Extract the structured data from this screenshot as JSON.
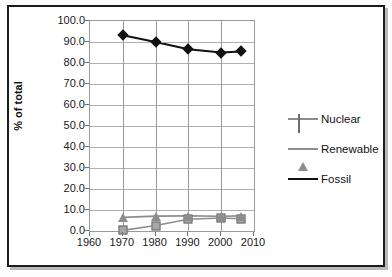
{
  "chart_data": {
    "type": "line",
    "title": "",
    "xlabel": "",
    "ylabel": "% of total",
    "xlim": [
      1960,
      2010
    ],
    "ylim": [
      0.0,
      100.0
    ],
    "grid": true,
    "legend_position": "right",
    "x": [
      1970,
      1980,
      1990,
      2000,
      2006
    ],
    "xticks": [
      "1960",
      "1970",
      "1980",
      "1990",
      "2000",
      "2010"
    ],
    "yticks": [
      "0.0",
      "10.0",
      "20.0",
      "30.0",
      "40.0",
      "50.0",
      "60.0",
      "70.0",
      "80.0",
      "90.0",
      "100.0"
    ],
    "series": [
      {
        "name": "Nuclear",
        "marker": "square",
        "color": "#8d8d8d",
        "marker_fill": "#a6a6a6",
        "values": [
          0.3,
          2.6,
          5.6,
          6.2,
          5.8
        ]
      },
      {
        "name": "Renewable",
        "marker": "triangle",
        "color": "#8d8d8d",
        "marker_fill": "#8d8d8d",
        "values": [
          6.5,
          7.1,
          7.2,
          7.0,
          7.2
        ]
      },
      {
        "name": "Fossil",
        "marker": "diamond",
        "color": "#111111",
        "marker_fill": "#111111",
        "values": [
          93.2,
          90.0,
          86.6,
          85.0,
          85.5
        ]
      }
    ]
  },
  "axis": {
    "y_label": "% of total"
  },
  "legend": {
    "items": [
      {
        "label": "Nuclear"
      },
      {
        "label": "Renewable"
      },
      {
        "label": "Fossil"
      }
    ]
  }
}
